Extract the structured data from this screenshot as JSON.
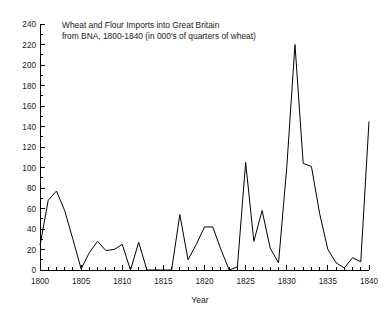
{
  "chart_data": {
    "type": "line",
    "title": "Wheat and Flour Imports into Great Britain from BNA, 1800-1840 (in 000's of quarters of wheat)",
    "title_line1": "Wheat and Flour Imports into Great Britain",
    "title_line2": "from BNA, 1800-1840 (in 000's of quarters of wheat)",
    "xlabel": "Year",
    "ylabel": "",
    "xlim": [
      1800,
      1840
    ],
    "ylim": [
      0,
      240
    ],
    "grid": false,
    "legend": "none",
    "line_color": "#000000",
    "background_color": "#ffffff",
    "x_major_ticks": [
      1800,
      1805,
      1810,
      1815,
      1820,
      1825,
      1830,
      1835,
      1840
    ],
    "x_major_tick_labels": [
      "1800",
      "1805",
      "1810",
      "1815",
      "1820",
      "1825",
      "1830",
      "1835",
      "1840"
    ],
    "x_minor_tick_step": 1,
    "y_major_ticks": [
      0,
      20,
      40,
      60,
      80,
      100,
      120,
      140,
      160,
      180,
      200,
      220,
      240
    ],
    "y_major_tick_labels": [
      "0",
      "20",
      "40",
      "60",
      "80",
      "100",
      "120",
      "140",
      "160",
      "180",
      "200",
      "220",
      "240"
    ],
    "y_minor_tick_step": 10,
    "x": [
      1800,
      1801,
      1802,
      1803,
      1804,
      1805,
      1806,
      1807,
      1808,
      1809,
      1810,
      1811,
      1812,
      1813,
      1814,
      1815,
      1816,
      1817,
      1818,
      1819,
      1820,
      1821,
      1822,
      1823,
      1824,
      1825,
      1826,
      1827,
      1828,
      1829,
      1830,
      1831,
      1832,
      1833,
      1834,
      1835,
      1836,
      1837,
      1838,
      1839,
      1840
    ],
    "values": [
      24,
      68,
      77,
      58,
      30,
      1,
      17,
      28,
      19,
      20,
      25,
      0,
      27,
      0,
      0,
      0,
      0,
      54,
      10,
      25,
      42,
      42,
      20,
      0,
      3,
      105,
      28,
      58,
      21,
      7,
      100,
      220,
      104,
      101,
      55,
      20,
      7,
      2,
      12,
      8,
      145
    ],
    "series": [
      {
        "name": "Wheat and Flour Imports from BNA",
        "values": [
          24,
          68,
          77,
          58,
          30,
          1,
          17,
          28,
          19,
          20,
          25,
          0,
          27,
          0,
          0,
          0,
          0,
          54,
          10,
          25,
          42,
          42,
          20,
          0,
          3,
          105,
          28,
          58,
          21,
          7,
          100,
          220,
          104,
          101,
          55,
          20,
          7,
          2,
          12,
          8,
          145
        ]
      }
    ]
  }
}
